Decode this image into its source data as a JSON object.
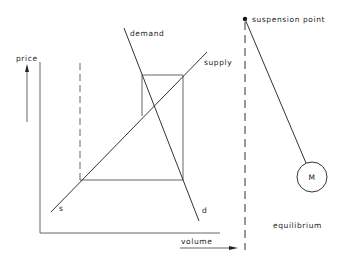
{
  "diagram": {
    "left_panel": {
      "axes": {
        "y_label": "price",
        "x_label": "volume"
      },
      "curves": {
        "demand": {
          "label": "demand",
          "end_label": "d"
        },
        "supply": {
          "label": "supply",
          "end_label": "s"
        }
      }
    },
    "right_panel": {
      "suspension_label": "suspension point",
      "mass_label": "M",
      "caption": "equilibrium"
    },
    "colors": {
      "line": "#333333",
      "background": "#ffffff"
    }
  }
}
